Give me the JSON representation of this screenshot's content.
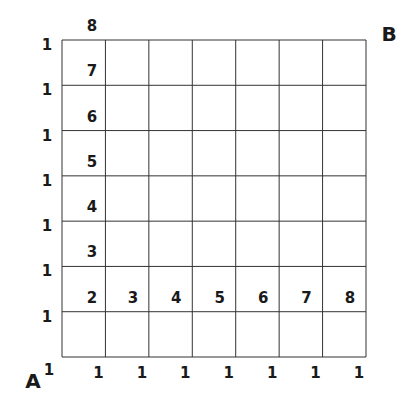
{
  "diagram": {
    "corner_labels": {
      "start": "A",
      "end": "B"
    },
    "grid": {
      "columns": 7,
      "rows": 7,
      "line_color": "#333333"
    },
    "left_edge_labels": [
      "1",
      "1",
      "1",
      "1",
      "1",
      "1",
      "1"
    ],
    "bottom_edge_labels": [
      "1",
      "1",
      "1",
      "1",
      "1",
      "1",
      "1",
      "1"
    ],
    "first_column_labels": [
      "2",
      "3",
      "4",
      "5",
      "6",
      "7",
      "8"
    ],
    "second_row_labels": [
      "3",
      "4",
      "5",
      "6",
      "7",
      "8"
    ]
  }
}
